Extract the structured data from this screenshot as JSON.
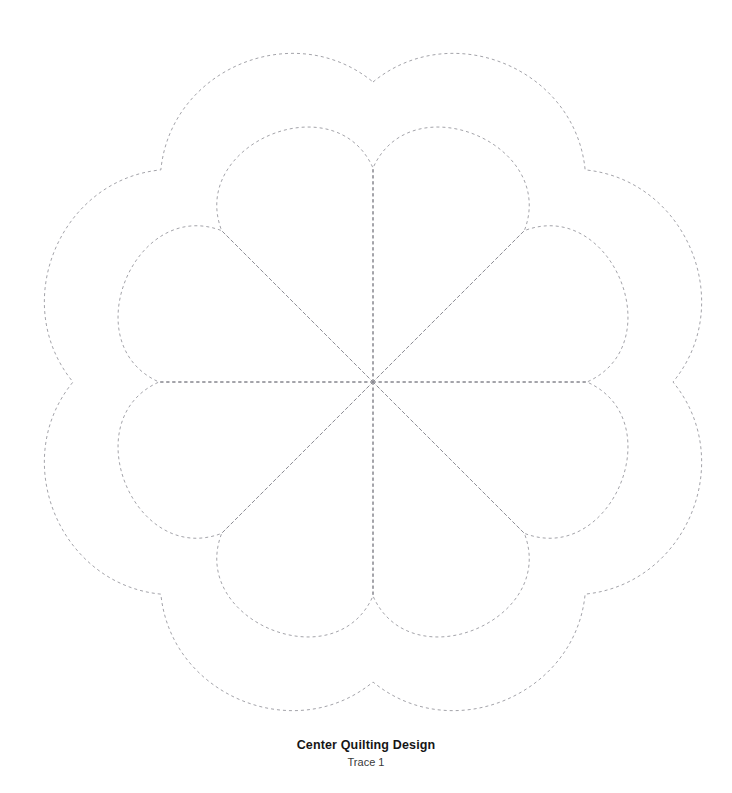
{
  "document": {
    "background_color": "#ffffff",
    "width": 732,
    "height": 793
  },
  "caption": {
    "title": "Center Quilting Design",
    "subtitle": "Trace 1"
  },
  "design": {
    "name": "eight-petal-scalloped-quilting-motif",
    "stroke_color": "#8b8b93",
    "stroke_style": "dashed",
    "dash_pattern": "3 3",
    "stroke_width": 0.8,
    "fill": "none",
    "center": {
      "x": 373,
      "y": 382
    },
    "symmetry_order": 8,
    "outer_scallop": {
      "label": "Outer scalloped border",
      "lobe_count": 8,
      "lobe_peak_radius": 336,
      "cusp_radius": 300,
      "bounds": {
        "left": 44,
        "top": 46,
        "right": 702,
        "bottom": 725
      }
    },
    "inner_petals": {
      "label": "Inner teardrop petals",
      "petal_count": 8,
      "petal_tip_radius": 232,
      "cusp_radius": 214,
      "petal_half_width": 86
    },
    "radial_lines": {
      "label": "Radial fold lines",
      "count": 8,
      "angles_deg": [
        0,
        45,
        90,
        135,
        180,
        225,
        270,
        315
      ],
      "length": 214
    }
  }
}
